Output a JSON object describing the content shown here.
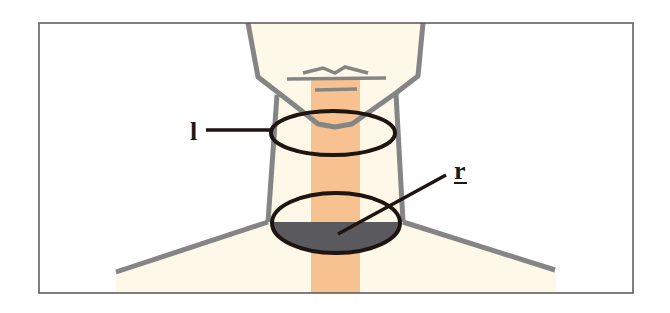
{
  "diagram": {
    "type": "anatomical-neck-schematic",
    "labels": [
      {
        "id": "l",
        "text": "l",
        "underlined": false,
        "points_to": "upper-neck-ellipse"
      },
      {
        "id": "r",
        "text": "r",
        "underlined": true,
        "points_to": "lower-neck-ellipse-shaded"
      }
    ],
    "colors": {
      "skin": "#fdf8e8",
      "outline": "#858585",
      "strip": "#f7c190",
      "ellipse_stroke": "#1e1410",
      "shaded_region": "#5a5a5e",
      "frame": "#555555"
    }
  }
}
